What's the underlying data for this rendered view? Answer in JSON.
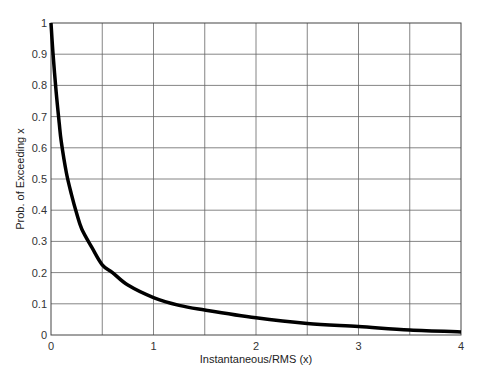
{
  "chart_data": {
    "type": "line",
    "title": "",
    "xlabel": "Instantaneous/RMS (x)",
    "ylabel": "Prob. of Exceeding x",
    "xlim": [
      0,
      4
    ],
    "ylim": [
      0,
      1
    ],
    "grid": true,
    "legend": null,
    "x_ticks": [
      "0",
      "1",
      "2",
      "3",
      "4"
    ],
    "y_ticks": [
      "0",
      "0.1",
      "0.2",
      "0.3",
      "0.4",
      "0.5",
      "0.6",
      "0.7",
      "0.8",
      "0.9",
      "1"
    ],
    "x_grid_step": 0.5,
    "y_grid_step": 0.1,
    "series": [
      {
        "name": "Prob. of Exceeding x",
        "color": "#000000",
        "x": [
          0.0,
          0.02,
          0.05,
          0.08,
          0.1,
          0.15,
          0.2,
          0.25,
          0.3,
          0.4,
          0.5,
          0.6,
          0.75,
          1.0,
          1.25,
          1.5,
          2.0,
          2.5,
          3.0,
          3.5,
          4.0
        ],
        "y": [
          1.0,
          0.9,
          0.78,
          0.68,
          0.62,
          0.52,
          0.45,
          0.39,
          0.34,
          0.28,
          0.225,
          0.2,
          0.16,
          0.12,
          0.095,
          0.08,
          0.055,
          0.037,
          0.027,
          0.016,
          0.01
        ]
      }
    ]
  }
}
